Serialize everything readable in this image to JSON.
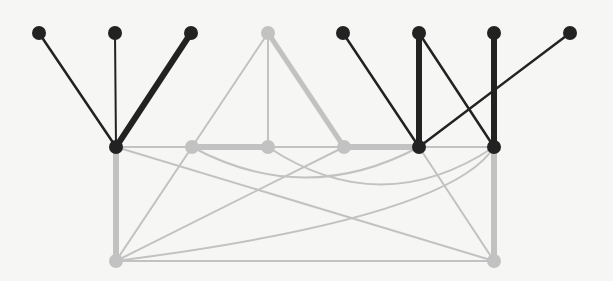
{
  "diagram": {
    "type": "graph",
    "colors": {
      "dark": "#222222",
      "light": "#c2c2c2",
      "background": "#f6f6f4"
    },
    "nodes": [
      {
        "id": "t1",
        "x": 39,
        "y": 33,
        "color": "dark"
      },
      {
        "id": "t2",
        "x": 115,
        "y": 33,
        "color": "dark"
      },
      {
        "id": "t3",
        "x": 191,
        "y": 33,
        "color": "dark"
      },
      {
        "id": "t4",
        "x": 268,
        "y": 33,
        "color": "light"
      },
      {
        "id": "t5",
        "x": 343,
        "y": 33,
        "color": "dark"
      },
      {
        "id": "t6",
        "x": 419,
        "y": 33,
        "color": "dark"
      },
      {
        "id": "t7",
        "x": 494,
        "y": 33,
        "color": "dark"
      },
      {
        "id": "t8",
        "x": 570,
        "y": 33,
        "color": "dark"
      },
      {
        "id": "m1",
        "x": 116,
        "y": 147,
        "color": "dark"
      },
      {
        "id": "m2",
        "x": 192,
        "y": 147,
        "color": "light"
      },
      {
        "id": "m3",
        "x": 268,
        "y": 147,
        "color": "light"
      },
      {
        "id": "m4",
        "x": 344,
        "y": 147,
        "color": "light"
      },
      {
        "id": "m5",
        "x": 419,
        "y": 147,
        "color": "dark"
      },
      {
        "id": "m6",
        "x": 494,
        "y": 147,
        "color": "dark"
      },
      {
        "id": "b1",
        "x": 116,
        "y": 261,
        "color": "light"
      },
      {
        "id": "b2",
        "x": 494,
        "y": 261,
        "color": "light"
      }
    ],
    "edges": [
      {
        "from": "t1",
        "to": "m1",
        "color": "dark",
        "width": 2.5
      },
      {
        "from": "t2",
        "to": "m1",
        "color": "dark",
        "width": 2
      },
      {
        "from": "t3",
        "to": "m1",
        "color": "dark",
        "width": 6
      },
      {
        "from": "t5",
        "to": "m5",
        "color": "dark",
        "width": 2.5
      },
      {
        "from": "t6",
        "to": "m5",
        "color": "dark",
        "width": 6
      },
      {
        "from": "t6",
        "to": "m6",
        "color": "dark",
        "width": 2.5
      },
      {
        "from": "t7",
        "to": "m6",
        "color": "dark",
        "width": 6
      },
      {
        "from": "t8",
        "to": "m5",
        "color": "dark",
        "width": 2.5
      },
      {
        "from": "t4",
        "to": "m2",
        "color": "light",
        "width": 2
      },
      {
        "from": "t4",
        "to": "m3",
        "color": "light",
        "width": 2
      },
      {
        "from": "t4",
        "to": "m4",
        "color": "light",
        "width": 5
      },
      {
        "from": "m2",
        "to": "m3",
        "color": "light",
        "width": 6
      },
      {
        "from": "m4",
        "to": "m5",
        "color": "light",
        "width": 6
      },
      {
        "from": "m1",
        "to": "m6",
        "color": "light",
        "width": 2
      },
      {
        "from": "m1",
        "to": "b1",
        "color": "light",
        "width": 6
      },
      {
        "from": "m6",
        "to": "b2",
        "color": "light",
        "width": 6
      },
      {
        "from": "b1",
        "to": "b2",
        "color": "light",
        "width": 2
      },
      {
        "from": "m1",
        "to": "b2",
        "color": "light",
        "width": 2
      },
      {
        "from": "b1",
        "to": "m2",
        "color": "light",
        "width": 2
      },
      {
        "from": "b1",
        "to": "m4",
        "color": "light",
        "width": 2
      },
      {
        "from": "m5",
        "to": "b2",
        "color": "light",
        "width": 2
      },
      {
        "from": "m2",
        "to": "m5",
        "color": "light",
        "width": 2,
        "curve": {
          "cx": 305,
          "cy": 208
        }
      },
      {
        "from": "m3",
        "to": "m6",
        "color": "light",
        "width": 2,
        "curve": {
          "cx": 381,
          "cy": 222
        }
      },
      {
        "from": "b1",
        "to": "m6",
        "color": "light",
        "width": 2,
        "curve": {
          "cx": 450,
          "cy": 218
        }
      }
    ]
  }
}
